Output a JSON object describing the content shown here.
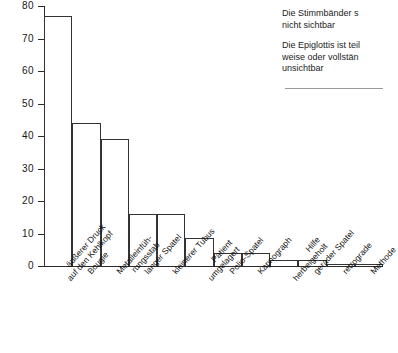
{
  "chart_data": {
    "type": "bar",
    "title": "",
    "subtitle": "",
    "xlabel": "",
    "ylabel": "",
    "ylim": [
      0,
      80
    ],
    "yticks": [
      0,
      10,
      20,
      30,
      40,
      50,
      60,
      70,
      80
    ],
    "grid": false,
    "legend": "none",
    "bar_style": "adjacent-outline",
    "categories": [
      "äußerer Druck auf den Kehlkopf",
      "Bougie",
      "Metalleinfüh- rungsstab",
      "langer Spatel",
      "kleinerer Tubus",
      "Patient umgelagert",
      "Polio-Spatel",
      "Kapnograph",
      "Hilfe herbeigeholt",
      "gerader Spatel",
      "retrograde",
      "Methode"
    ],
    "category_lines": [
      [
        "äußerer Druck",
        "auf den Kehlkopf"
      ],
      [
        "Bougie"
      ],
      [
        "Metalleinfüh-",
        "rungsstab"
      ],
      [
        "langer Spatel"
      ],
      [
        "kleinerer Tubus"
      ],
      [
        "Patient",
        "umgelagert"
      ],
      [
        "Polio-Spatel"
      ],
      [
        "Kapnograph"
      ],
      [
        "Hilfe",
        "herbeigeholt"
      ],
      [
        "gerader Spatel"
      ],
      [
        "retrograde"
      ],
      [
        "Methode"
      ]
    ],
    "values": [
      77,
      44,
      39,
      16,
      16,
      8.5,
      4,
      4,
      2,
      2,
      0.7,
      0.7
    ],
    "colors": {
      "bar_fill": "#ffffff",
      "bar_stroke": "#333333",
      "axis": "#2b2b2b",
      "text": "#1a1a1a",
      "rule": "#9a9a9a"
    }
  },
  "annotations": {
    "notes": [
      "Die Stimmbänder s\nnicht sichtbar",
      "Die Epiglottis ist teil\nweise oder vollstän\nunsichtbar"
    ],
    "note1_line1": "Die Stimmbänder s",
    "note1_line2": "nicht sichtbar",
    "note2_line1": "Die Epiglottis ist teil",
    "note2_line2": "weise oder vollstän",
    "note2_line3": "unsichtbar"
  }
}
